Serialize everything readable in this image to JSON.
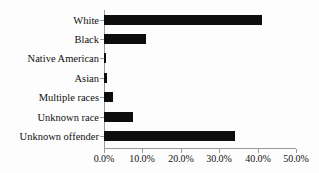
{
  "chart_data": {
    "type": "bar",
    "orientation": "horizontal",
    "title": "",
    "subtitle": "",
    "xlabel": "",
    "ylabel": "",
    "categories": [
      "White",
      "Black",
      "Native American",
      "Asian",
      "Multiple races",
      "Unknown race",
      "Unknown offender"
    ],
    "values": [
      41.2,
      11.0,
      0.6,
      0.7,
      2.4,
      7.6,
      34.0
    ],
    "value_unit": "%",
    "xlim": [
      0.0,
      50.0
    ],
    "xticks": [
      0.0,
      10.0,
      20.0,
      30.0,
      40.0,
      50.0
    ],
    "xtick_labels": [
      "0.0%",
      "10.0%",
      "20.0%",
      "30.0%",
      "40.0%",
      "50.0%"
    ],
    "grid": false,
    "legend": false,
    "legend_position": "none",
    "bar_color": "#0d0d0d",
    "axis_color": "#9a9a9a",
    "background_color": "#fdfdfd",
    "text_color": "#111111"
  }
}
